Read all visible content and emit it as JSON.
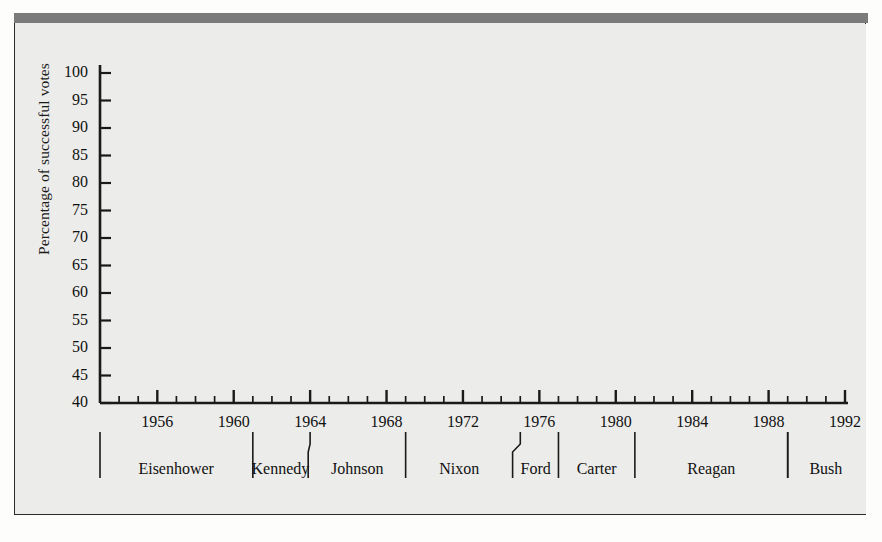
{
  "figure": {
    "background_color": "#ececea",
    "top_rule_color": "#7b7b7b",
    "frame_color": "#2b2b2b"
  },
  "chart_data": {
    "type": "area",
    "title": "",
    "xlabel": "",
    "ylabel": "Percentage of successful votes",
    "xlim": [
      1953,
      1992
    ],
    "ylim": [
      40,
      100
    ],
    "ytick_step": 5,
    "xtick_step": 4,
    "minor_xtick_step": 1,
    "grid": false,
    "legend": "none",
    "line_color": "#6b6b6b",
    "fill_color": "#bfbfbd",
    "yticks": [
      40,
      45,
      50,
      55,
      60,
      65,
      70,
      75,
      80,
      85,
      90,
      95,
      100
    ],
    "xticks": [
      1956,
      1960,
      1964,
      1968,
      1972,
      1976,
      1980,
      1984,
      1988,
      1992
    ],
    "x": [
      1953,
      1954,
      1955,
      1956,
      1957,
      1958,
      1959,
      1960,
      1961,
      1962,
      1963,
      1964,
      1965,
      1966,
      1967,
      1968,
      1969,
      1970,
      1971,
      1972,
      1973,
      1974,
      1975,
      1976,
      1977,
      1978,
      1979,
      1980,
      1981,
      1982,
      1983,
      1984,
      1985,
      1986,
      1987,
      1988,
      1989,
      1990,
      1991,
      1992
    ],
    "values": [
      89.0,
      82.8,
      75.0,
      70.0,
      69.0,
      76.5,
      52.5,
      65.0,
      80.0,
      85.5,
      87.0,
      86.5,
      92.5,
      78.0,
      78.0,
      74.5,
      75.5,
      77.0,
      75.0,
      66.0,
      50.0,
      60.0,
      61.5,
      53.5,
      75.5,
      78.0,
      77.0,
      75.0,
      82.5,
      72.5,
      67.5,
      66.0,
      60.0,
      56.5,
      43.5,
      47.5,
      63.5,
      46.5,
      57.0,
      43.0
    ],
    "series_name": "Percentage of successful presidential votes in Congress",
    "presidents": [
      {
        "name": "Eisenhower",
        "start": 1953,
        "end": 1961
      },
      {
        "name": "Kennedy",
        "start": 1961,
        "end": 1963.9
      },
      {
        "name": "Johnson",
        "start": 1963.9,
        "end": 1969
      },
      {
        "name": "Nixon",
        "start": 1969,
        "end": 1974.6
      },
      {
        "name": "Ford",
        "start": 1974.6,
        "end": 1977
      },
      {
        "name": "Carter",
        "start": 1977,
        "end": 1981
      },
      {
        "name": "Reagan",
        "start": 1981,
        "end": 1989
      },
      {
        "name": "Bush",
        "start": 1989,
        "end": 1993
      }
    ]
  }
}
